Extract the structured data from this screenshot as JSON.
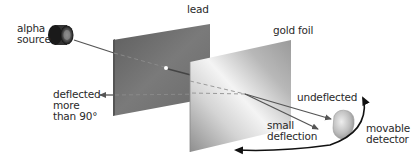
{
  "diagram": {
    "labels": {
      "alpha_source": "alpha\nsource",
      "lead": "lead",
      "gold_foil": "gold foil",
      "deflected_more": "deflected\nmore\nthan 90°",
      "undeflected": "undeflected",
      "small_deflection": "small\ndeflection",
      "movable_detector": "movable\ndetector"
    },
    "colors": {
      "lead_plate": "#6f6f6f",
      "gold_foil_light": "#f2f2f2",
      "gold_foil_dark": "#9a9a9a",
      "beam": "#555555",
      "arc": "#111111",
      "text": "#2a2a2a"
    }
  }
}
